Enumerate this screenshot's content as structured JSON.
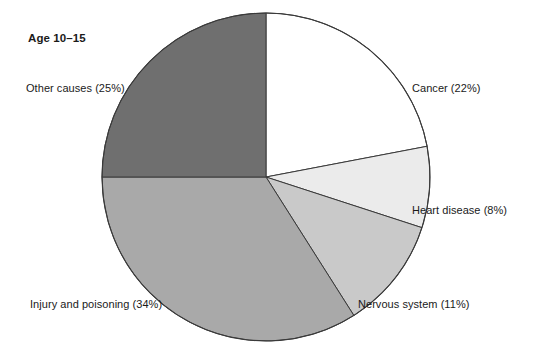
{
  "chart": {
    "title": "Age 10–15",
    "background": "#ffffff",
    "outline_color": "#3a3a3a",
    "center": {
      "x": 266,
      "y": 177
    },
    "radius": 164,
    "start_angle_deg": 0
  },
  "chart_data": {
    "type": "pie",
    "title": "Age 10–15",
    "xlabel": "",
    "ylabel": "",
    "categories": [
      "Cancer",
      "Heart disease",
      "Nervous system",
      "Injury and poisoning",
      "Other causes"
    ],
    "values": [
      22,
      8,
      11,
      34,
      25
    ],
    "unit": "%",
    "legend_position": "none",
    "grid": false,
    "slices": [
      {
        "id": "cancer",
        "name": "Cancer",
        "value": 22,
        "label": "Cancer (22%)",
        "color": "#ffffff",
        "start_angle": 0,
        "end_angle": 79.2,
        "label_pos": {
          "x": 412,
          "y": 82
        },
        "label_align": "left"
      },
      {
        "id": "heart-disease",
        "name": "Heart disease",
        "value": 8,
        "label": "Heart disease (8%)",
        "color": "#ebebeb",
        "start_angle": 79.2,
        "end_angle": 108.0,
        "label_pos": {
          "x": 412,
          "y": 204
        },
        "label_align": "left"
      },
      {
        "id": "nervous-system",
        "name": "Nervous system",
        "value": 11,
        "label": "Nervous system (11%)",
        "color": "#c9c9c9",
        "start_angle": 108.0,
        "end_angle": 147.6,
        "label_pos": {
          "x": 358,
          "y": 298
        },
        "label_align": "left"
      },
      {
        "id": "injury-and-poisoning",
        "name": "Injury and poisoning",
        "value": 34,
        "label": "Injury and poisoning (34%)",
        "color": "#a9a9a9",
        "start_angle": 147.6,
        "end_angle": 270.0,
        "label_pos": {
          "x": 30,
          "y": 298
        },
        "label_align": "left"
      },
      {
        "id": "other-causes",
        "name": "Other causes",
        "value": 25,
        "label": "Other causes (25%)",
        "color": "#6f6f6f",
        "start_angle": 270.0,
        "end_angle": 360.0,
        "label_pos": {
          "x": 26,
          "y": 82
        },
        "label_align": "left"
      }
    ]
  }
}
